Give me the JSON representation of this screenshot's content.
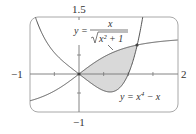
{
  "chart_data": {
    "type": "line",
    "title": "",
    "xlabel": "",
    "ylabel": "",
    "xlim": [
      -1,
      2
    ],
    "ylim": [
      -1,
      1.5
    ],
    "grid": false,
    "axis_labels": {
      "x_min": "−1",
      "x_max": "2",
      "y_max": "1.5",
      "y_min": "−1"
    },
    "x_ticks": [
      -0.5,
      0,
      0.5,
      1,
      1.5
    ],
    "y_ticks": [
      -0.5,
      0,
      0.5,
      1
    ],
    "series": [
      {
        "name": "y = x/√(x²+1)",
        "label_parts": {
          "lhs": "y =",
          "num": "x",
          "den": "x² + 1"
        },
        "function": "x/sqrt(x^2+1)",
        "x": [
          -1,
          -0.5,
          0,
          0.5,
          1,
          1.18,
          1.5,
          2
        ],
        "values": [
          -0.707,
          -0.447,
          0,
          0.447,
          0.707,
          0.763,
          0.832,
          0.894
        ]
      },
      {
        "name": "y = x⁴ − x",
        "label_parts": {
          "lhs": "y = x",
          "exp": "4",
          "rhs": " − x"
        },
        "function": "x^4 - x",
        "x": [
          -0.8,
          -0.5,
          0,
          0.5,
          0.63,
          1,
          1.18
        ],
        "values": [
          1.21,
          0.5625,
          0,
          -0.4375,
          -0.47,
          0,
          0.76
        ]
      }
    ],
    "shaded_region": {
      "between": [
        "y = x/√(x²+1)",
        "y = x⁴ − x"
      ],
      "x_range": [
        0,
        1.18
      ],
      "color": "#d9d9d9"
    },
    "intersection_points": [
      [
        0,
        0
      ],
      [
        1.18,
        0.763
      ]
    ],
    "colors": {
      "curve": "#555555",
      "axis": "#777777",
      "frame": "#999999",
      "shade": "#d9d9d9"
    }
  }
}
